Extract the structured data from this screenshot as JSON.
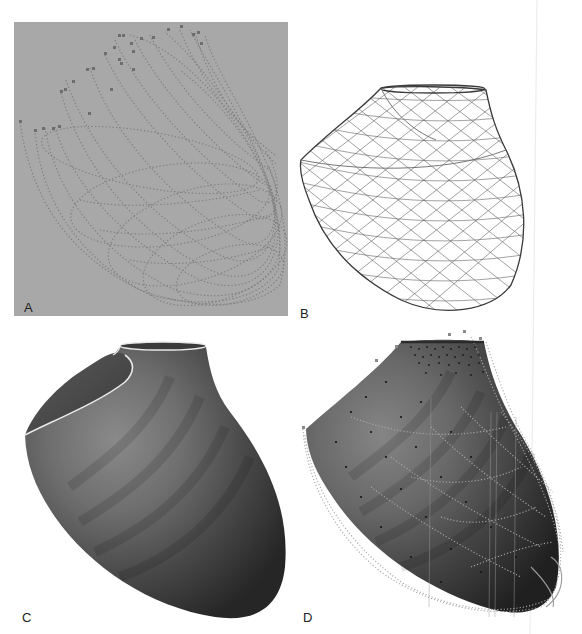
{
  "figure": {
    "panels": [
      {
        "id": "A",
        "label": "A",
        "description": "dotted fiber trajectories on gray background",
        "background": "#a8a8a8",
        "stroke": "#7a7a7a"
      },
      {
        "id": "B",
        "label": "B",
        "description": "wireframe triangular mesh",
        "background": "#ffffff",
        "stroke": "#555555"
      },
      {
        "id": "C",
        "label": "C",
        "description": "shaded surface model",
        "background": "#ffffff",
        "fill_light": "#7d7d7d",
        "fill_dark": "#2e2e2e",
        "rim": "#e8e8e8"
      },
      {
        "id": "D",
        "label": "D",
        "description": "shaded surface with overlaid data points and trajectories",
        "background": "#ffffff",
        "fill_light": "#7a7a7a",
        "fill_dark": "#262626",
        "points": "#1a1a1a",
        "overlay": "#9a9a9a"
      }
    ]
  }
}
